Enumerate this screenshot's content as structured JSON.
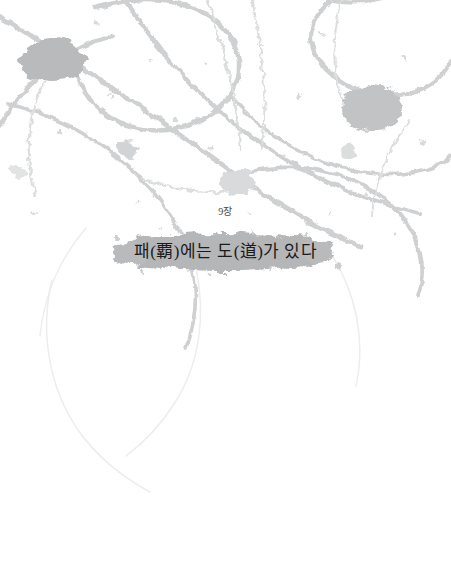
{
  "page": {
    "background_color": "#ffffff",
    "width": 451,
    "height": 578
  },
  "chapter": {
    "label": "9장",
    "title": "패(覇)에는 도(道)가 있다",
    "title_color": "#1b1b1b",
    "label_color": "#4a4a4a"
  },
  "artwork": {
    "name": "ink-splatter-decoration",
    "ink_color": "#cfd0d1",
    "ink_color_light": "#e0e1e2",
    "ink_color_faint": "#ededee",
    "blot_color": "#b9babb",
    "title_blot_color": "#b5b6b7",
    "description": "회색 먹물 튀김 장식"
  }
}
